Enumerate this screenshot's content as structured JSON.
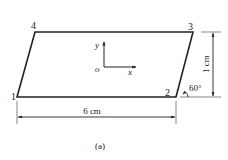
{
  "figure": {
    "caption": "(a)",
    "shape": "parallelogram",
    "vertices": [
      {
        "id": "1",
        "label": "1"
      },
      {
        "id": "2",
        "label": "2"
      },
      {
        "id": "3",
        "label": "3"
      },
      {
        "id": "4",
        "label": "4"
      }
    ],
    "axes": {
      "x_label": "x",
      "y_label": "y",
      "origin_label": "o"
    },
    "dimensions": {
      "width_label": "6 cm",
      "height_label": "1 cm",
      "angle_label": "60°"
    },
    "colors": {
      "stroke": "#222222",
      "dim_line": "#555555",
      "background": "#ffffff"
    }
  }
}
